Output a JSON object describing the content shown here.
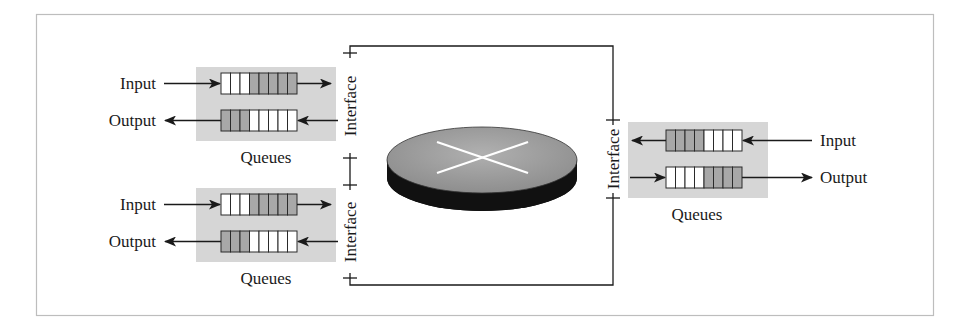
{
  "diagram": {
    "type": "router-components",
    "colors": {
      "frame": "#bdbdbd",
      "line": "#1a1a1a",
      "queue_panel": "#d6d6d6",
      "cell_empty": "#ffffff",
      "cell_filled": "#a8a8a8",
      "disk_top": "#a0a0a0",
      "disk_side": "#111111",
      "disk_cross": "#ffffff"
    },
    "interfaces": [
      {
        "id": "left-top",
        "label": "Interface"
      },
      {
        "id": "left-bottom",
        "label": "Interface"
      },
      {
        "id": "right",
        "label": "Interface"
      }
    ],
    "queue_groups": [
      {
        "id": "left-top",
        "caption": "Queues",
        "input_label": "Input",
        "output_label": "Output",
        "input_queue_cells": [
          0,
          0,
          0,
          1,
          1,
          1,
          1,
          1
        ],
        "output_queue_cells": [
          1,
          1,
          1,
          0,
          0,
          0,
          0,
          0
        ]
      },
      {
        "id": "left-bottom",
        "caption": "Queues",
        "input_label": "Input",
        "output_label": "Output",
        "input_queue_cells": [
          0,
          0,
          0,
          1,
          1,
          1,
          1,
          1
        ],
        "output_queue_cells": [
          1,
          1,
          1,
          0,
          0,
          0,
          0,
          0
        ]
      },
      {
        "id": "right",
        "caption": "Queues",
        "input_label": "Input",
        "output_label": "Output",
        "input_queue_cells": [
          1,
          1,
          1,
          1,
          0,
          0,
          0,
          0
        ],
        "output_queue_cells": [
          0,
          0,
          0,
          0,
          1,
          1,
          1,
          1
        ]
      }
    ],
    "switch_fabric": {
      "icon": "router-disk-icon"
    }
  }
}
